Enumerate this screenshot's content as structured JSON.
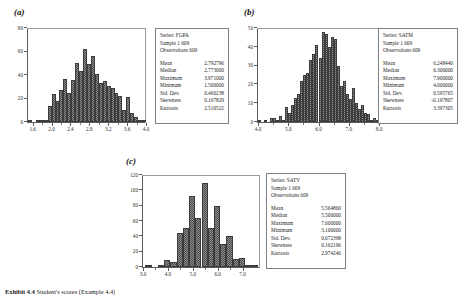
{
  "figure": {
    "caption_label": "Exhibit 4.4",
    "caption_text": "Student's scores (Example 4.4)"
  },
  "panels": [
    {
      "label": "(a)",
      "chart_data": {
        "type": "bar",
        "title": "",
        "xlabel": "",
        "ylabel": "",
        "xlim": [
          1.5,
          4.0
        ],
        "ylim": [
          0,
          80
        ],
        "xticks": [
          "1.6",
          "2.0",
          "2.4",
          "2.8",
          "3.2",
          "3.6",
          "4.0"
        ],
        "xtick_values": [
          1.6,
          2.0,
          2.4,
          2.8,
          3.2,
          3.6,
          4.0
        ],
        "yticks": [
          "0",
          "20",
          "40",
          "60",
          "80"
        ],
        "ytick_values": [
          0,
          20,
          40,
          60,
          80
        ],
        "grid": false,
        "bin_width": 0.0833,
        "bin_starts": [
          1.5,
          1.5833,
          1.6667,
          1.75,
          1.8333,
          1.9167,
          2.0,
          2.0833,
          2.1667,
          2.25,
          2.3333,
          2.4167,
          2.5,
          2.5833,
          2.6667,
          2.75,
          2.8333,
          2.9167,
          3.0,
          3.0833,
          3.1667,
          3.25,
          3.3333,
          3.4167,
          3.5,
          3.5833,
          3.6667,
          3.75,
          3.8333,
          3.9167
        ],
        "values": [
          1,
          0,
          1,
          1,
          2,
          14,
          24,
          18,
          27,
          37,
          25,
          36,
          50,
          43,
          62,
          49,
          56,
          41,
          33,
          35,
          31,
          29,
          25,
          22,
          10,
          21,
          8,
          4,
          1,
          2
        ]
      },
      "stats": {
        "series_label": "Series:",
        "series_value": "FGPA",
        "sample_label": "Sample",
        "sample_value": "1 609",
        "observations_label": "Observations",
        "observations_value": "609",
        "rows": [
          {
            "key": "Mean",
            "value": "2.792796"
          },
          {
            "key": "Median",
            "value": "2.773000"
          },
          {
            "key": "Maximum",
            "value": "3.971000"
          },
          {
            "key": "Minimum",
            "value": "1.500000"
          },
          {
            "key": "Std. Dev.",
            "value": "0.460238"
          },
          {
            "key": "Skewness",
            "value": "0.167829"
          },
          {
            "key": "Kurtosis",
            "value": "2.510522"
          }
        ]
      }
    },
    {
      "label": "(b)",
      "chart_data": {
        "type": "bar",
        "title": "",
        "xlabel": "",
        "ylabel": "",
        "xlim": [
          4.0,
          8.0
        ],
        "ylim": [
          0,
          50
        ],
        "xticks": [
          "4.0",
          "5.0",
          "6.0",
          "7.0",
          "8.0"
        ],
        "xtick_values": [
          4.0,
          5.0,
          6.0,
          7.0,
          8.0
        ],
        "yticks": [
          "0",
          "10",
          "20",
          "30",
          "40",
          "50"
        ],
        "ytick_values": [
          0,
          10,
          20,
          30,
          40,
          50
        ],
        "grid": false,
        "bin_width": 0.1,
        "bin_starts": [
          4.0,
          4.1,
          4.2,
          4.3,
          4.4,
          4.5,
          4.6,
          4.7,
          4.8,
          4.9,
          5.0,
          5.1,
          5.2,
          5.3,
          5.4,
          5.5,
          5.6,
          5.7,
          5.8,
          5.9,
          6.0,
          6.1,
          6.2,
          6.3,
          6.4,
          6.5,
          6.6,
          6.7,
          6.8,
          6.9,
          7.0,
          7.1,
          7.2,
          7.3,
          7.4,
          7.5,
          7.6,
          7.7,
          7.8,
          7.9
        ],
        "values": [
          1,
          0,
          1,
          0,
          2,
          2,
          1,
          3,
          1,
          8,
          5,
          9,
          13,
          15,
          22,
          25,
          26,
          33,
          36,
          41,
          34,
          48,
          47,
          40,
          45,
          44,
          30,
          19,
          22,
          15,
          12,
          18,
          10,
          7,
          9,
          5,
          4,
          1,
          2,
          1
        ]
      },
      "stats": {
        "series_label": "Series:",
        "series_value": "SATM",
        "sample_label": "Sample",
        "sample_value": "1 609",
        "observations_label": "Observations",
        "observations_value": "609",
        "rows": [
          {
            "key": "Mean",
            "value": "6.248440"
          },
          {
            "key": "Median",
            "value": "6.300000"
          },
          {
            "key": "Maximum",
            "value": "7.900000"
          },
          {
            "key": "Minimum",
            "value": "4.000000"
          },
          {
            "key": "Std. Dev.",
            "value": "0.595765"
          },
          {
            "key": "Skewness",
            "value": "-0.197807"
          },
          {
            "key": "Kurtosis",
            "value": "3.397305"
          }
        ]
      }
    },
    {
      "label": "(c)",
      "chart_data": {
        "type": "bar",
        "title": "",
        "xlabel": "",
        "ylabel": "",
        "xlim": [
          3.0,
          7.7
        ],
        "ylim": [
          0,
          120
        ],
        "xticks": [
          "3.0",
          "4.0",
          "5.0",
          "6.0",
          "7.0"
        ],
        "xtick_values": [
          3.0,
          4.0,
          5.0,
          6.0,
          7.0
        ],
        "yticks": [
          "0",
          "20",
          "40",
          "60",
          "80",
          "100",
          "120"
        ],
        "ytick_values": [
          0,
          20,
          40,
          60,
          80,
          100,
          120
        ],
        "grid": false,
        "bin_width": 0.25,
        "bin_starts": [
          3.1,
          3.35,
          3.6,
          3.85,
          4.1,
          4.35,
          4.6,
          4.85,
          5.1,
          5.35,
          5.6,
          5.85,
          6.1,
          6.35,
          6.6,
          6.85,
          7.1,
          7.35
        ],
        "values": [
          1,
          0,
          2,
          9,
          6,
          44,
          51,
          93,
          64,
          110,
          51,
          80,
          30,
          40,
          10,
          12,
          3,
          1
        ]
      },
      "stats": {
        "series_label": "Series:",
        "series_value": "SATV",
        "sample_label": "Sample",
        "sample_value": "1 609",
        "observations_label": "Observations",
        "observations_value": "609",
        "rows": [
          {
            "key": "Mean",
            "value": "5.564860"
          },
          {
            "key": "Median",
            "value": "5.500000"
          },
          {
            "key": "Maximum",
            "value": "7.600000"
          },
          {
            "key": "Minimum",
            "value": "3.100000"
          },
          {
            "key": "Std. Dev.",
            "value": "0.672398"
          },
          {
            "key": "Skewness",
            "value": "0.162196"
          },
          {
            "key": "Kurtosis",
            "value": "2.974246"
          }
        ]
      }
    }
  ]
}
